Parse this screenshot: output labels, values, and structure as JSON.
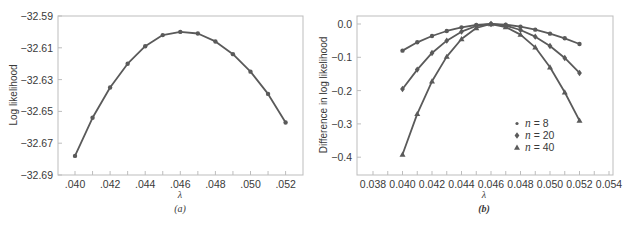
{
  "chart_data": [
    {
      "id": "a",
      "type": "line",
      "panel_label": "(a)",
      "title": "",
      "xlabel": "λ",
      "ylabel": "Log likelihood",
      "xlim": [
        0.039,
        0.053
      ],
      "ylim": [
        -32.69,
        -32.59
      ],
      "x_ticks": [
        ".040",
        ".042",
        ".044",
        ".046",
        ".048",
        ".050",
        ".052"
      ],
      "y_ticks": [
        "-32.59",
        "-32.61",
        "-32.63",
        "-32.65",
        "-32.67",
        "-32.69"
      ],
      "grid": false,
      "x": [
        0.04,
        0.041,
        0.042,
        0.043,
        0.044,
        0.045,
        0.046,
        0.047,
        0.048,
        0.049,
        0.05,
        0.051,
        0.052
      ],
      "series": [
        {
          "name": "Log likelihood",
          "marker": "circle",
          "values": [
            -32.678,
            -32.654,
            -32.635,
            -32.62,
            -32.609,
            -32.602,
            -32.6,
            -32.601,
            -32.606,
            -32.614,
            -32.625,
            -32.639,
            -32.657
          ]
        }
      ]
    },
    {
      "id": "b",
      "type": "line",
      "panel_label": "(b)",
      "title": "",
      "xlabel": "λ",
      "ylabel": "Difference in log likelihood",
      "xlim": [
        0.037,
        0.0545
      ],
      "ylim": [
        -0.45,
        0.03
      ],
      "x_ticks": [
        "0.038",
        "0.040",
        "0.042",
        "0.044",
        "0.046",
        "0.048",
        "0.050",
        "0.052",
        "0.054"
      ],
      "y_ticks": [
        "0.0",
        "-0.1",
        "-0.2",
        "-0.3",
        "-0.4"
      ],
      "grid": false,
      "legend_position": "lower right inside",
      "x": [
        0.04,
        0.041,
        0.042,
        0.043,
        0.044,
        0.045,
        0.046,
        0.047,
        0.048,
        0.049,
        0.05,
        0.051,
        0.052
      ],
      "series": [
        {
          "name": "n = 8",
          "marker": "circle",
          "values": [
            -0.08,
            -0.055,
            -0.036,
            -0.021,
            -0.01,
            -0.003,
            0.0,
            -0.002,
            -0.008,
            -0.017,
            -0.029,
            -0.043,
            -0.06
          ]
        },
        {
          "name": "n = 20",
          "marker": "diamond",
          "values": [
            -0.195,
            -0.137,
            -0.087,
            -0.05,
            -0.023,
            -0.006,
            0.0,
            -0.005,
            -0.018,
            -0.038,
            -0.066,
            -0.102,
            -0.147
          ]
        },
        {
          "name": "n = 40",
          "marker": "triangle",
          "values": [
            -0.392,
            -0.27,
            -0.172,
            -0.098,
            -0.045,
            -0.012,
            0.0,
            -0.009,
            -0.032,
            -0.07,
            -0.13,
            -0.205,
            -0.29
          ]
        }
      ]
    }
  ],
  "panels": {
    "a": {
      "label": "(a)",
      "xlabel": "λ",
      "ylabel": "Log likelihood",
      "x_ticks": [
        ".040",
        ".042",
        ".044",
        ".046",
        ".048",
        ".050",
        ".052"
      ],
      "y_ticks": [
        "-32.59",
        "-32.61",
        "-32.63",
        "-32.65",
        "-32.67",
        "-32.69"
      ]
    },
    "b": {
      "label": "(b)",
      "xlabel": "λ",
      "ylabel": "Difference in log likelihood",
      "x_ticks": [
        "0.038",
        "0.040",
        "0.042",
        "0.044",
        "0.046",
        "0.048",
        "0.050",
        "0.052",
        "0.054"
      ],
      "y_ticks": [
        "0.0",
        "-0.1",
        "-0.2",
        "-0.3",
        "-0.4"
      ],
      "legend": [
        {
          "italic": "n",
          "rest": " = 8"
        },
        {
          "italic": "n",
          "rest": " = 20"
        },
        {
          "italic": "n",
          "rest": " = 40"
        }
      ]
    }
  },
  "colors": {
    "line": "#5a5a5a",
    "frame": "#bdbdbd",
    "text": "#3a3a3a"
  }
}
